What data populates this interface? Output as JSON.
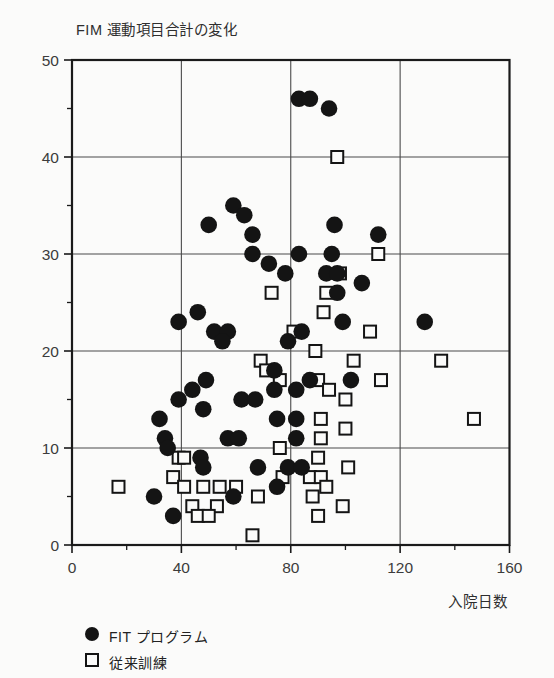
{
  "title": "FIM 運動項目合計の変化",
  "x_axis": {
    "label": "入院日数",
    "ticks": [
      0,
      40,
      80,
      120,
      160
    ],
    "minor_ticks": [
      20,
      60,
      100,
      140
    ]
  },
  "y_axis": {
    "ticks": [
      0,
      10,
      20,
      30,
      40,
      50
    ],
    "minor_ticks": [
      5,
      15,
      25,
      35,
      45
    ]
  },
  "legend": [
    {
      "marker": "filled-circle",
      "label": "FIT プログラム"
    },
    {
      "marker": "open-square",
      "label": "従来訓練"
    }
  ],
  "colors": {
    "marker": "#141414",
    "frame": "#1a1a1a",
    "grid": "#4a4a4a",
    "tick_text": "#3c3c3c",
    "background": "#fbfbfa"
  },
  "chart_data": {
    "type": "scatter",
    "title": "FIM 運動項目合計の変化",
    "xlabel": "入院日数",
    "ylabel": "FIM 運動項目合計の変化",
    "xlim": [
      0,
      160
    ],
    "ylim": [
      0,
      50
    ],
    "grid": "major-on",
    "legend_position": "bottom-left",
    "series": [
      {
        "name": "FIT プログラム",
        "marker": "filled-circle",
        "points": [
          [
            83,
            46
          ],
          [
            87,
            46
          ],
          [
            94,
            45
          ],
          [
            59,
            35
          ],
          [
            63,
            34
          ],
          [
            50,
            33
          ],
          [
            96,
            33
          ],
          [
            66,
            32
          ],
          [
            112,
            32
          ],
          [
            66,
            30
          ],
          [
            83,
            30
          ],
          [
            95,
            30
          ],
          [
            72,
            29
          ],
          [
            78,
            28
          ],
          [
            93,
            28
          ],
          [
            97,
            28
          ],
          [
            106,
            27
          ],
          [
            97,
            26
          ],
          [
            46,
            24
          ],
          [
            39,
            23
          ],
          [
            99,
            23
          ],
          [
            129,
            23
          ],
          [
            52,
            22
          ],
          [
            57,
            22
          ],
          [
            84,
            22
          ],
          [
            55,
            21
          ],
          [
            79,
            21
          ],
          [
            74,
            18
          ],
          [
            49,
            17
          ],
          [
            87,
            17
          ],
          [
            102,
            17
          ],
          [
            44,
            16
          ],
          [
            74,
            16
          ],
          [
            82,
            16
          ],
          [
            62,
            15
          ],
          [
            67,
            15
          ],
          [
            39,
            15
          ],
          [
            48,
            14
          ],
          [
            32,
            13
          ],
          [
            75,
            13
          ],
          [
            82,
            13
          ],
          [
            34,
            11
          ],
          [
            35,
            10
          ],
          [
            57,
            11
          ],
          [
            61,
            11
          ],
          [
            82,
            11
          ],
          [
            47,
            9
          ],
          [
            48,
            8
          ],
          [
            68,
            8
          ],
          [
            79,
            8
          ],
          [
            84,
            8
          ],
          [
            30,
            5
          ],
          [
            59,
            5
          ],
          [
            75,
            6
          ],
          [
            37,
            3
          ]
        ]
      },
      {
        "name": "従来訓練",
        "marker": "open-square",
        "points": [
          [
            97,
            40
          ],
          [
            112,
            30
          ],
          [
            98,
            28
          ],
          [
            73,
            26
          ],
          [
            93,
            26
          ],
          [
            92,
            24
          ],
          [
            81,
            22
          ],
          [
            109,
            22
          ],
          [
            89,
            20
          ],
          [
            103,
            19
          ],
          [
            135,
            19
          ],
          [
            69,
            19
          ],
          [
            71,
            18
          ],
          [
            76,
            17
          ],
          [
            90,
            17
          ],
          [
            113,
            17
          ],
          [
            94,
            16
          ],
          [
            100,
            15
          ],
          [
            91,
            13
          ],
          [
            147,
            13
          ],
          [
            100,
            12
          ],
          [
            91,
            11
          ],
          [
            76,
            10
          ],
          [
            39,
            9
          ],
          [
            41,
            9
          ],
          [
            90,
            9
          ],
          [
            101,
            8
          ],
          [
            37,
            7
          ],
          [
            77,
            7
          ],
          [
            87,
            7
          ],
          [
            91,
            7
          ],
          [
            17,
            6
          ],
          [
            41,
            6
          ],
          [
            48,
            6
          ],
          [
            54,
            6
          ],
          [
            60,
            6
          ],
          [
            93,
            6
          ],
          [
            68,
            5
          ],
          [
            88,
            5
          ],
          [
            44,
            4
          ],
          [
            53,
            4
          ],
          [
            99,
            4
          ],
          [
            46,
            3
          ],
          [
            50,
            3
          ],
          [
            90,
            3
          ],
          [
            66,
            1
          ]
        ]
      }
    ]
  }
}
